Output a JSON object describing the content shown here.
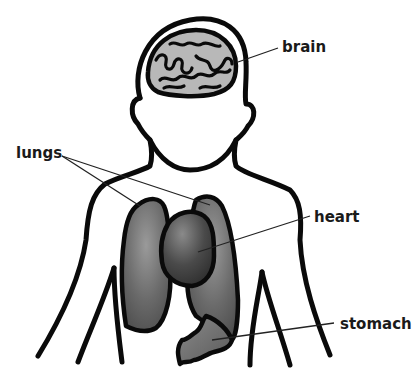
{
  "diagram": {
    "labels": [
      {
        "id": "brain",
        "text": "brain"
      },
      {
        "id": "lungs",
        "text": "lungs"
      },
      {
        "id": "heart",
        "text": "heart"
      },
      {
        "id": "stomach",
        "text": "stomach"
      }
    ],
    "colors": {
      "outline": "#0a0a0a",
      "brain_fill": "#b8b8b8",
      "lung_fill": "#6e6e6e",
      "heart_fill": "#4a4a4a",
      "stomach_fill": "#7a7a7a",
      "background": "#ffffff"
    }
  }
}
